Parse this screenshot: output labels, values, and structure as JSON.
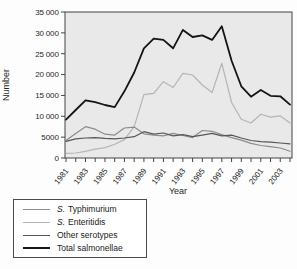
{
  "chart_data": {
    "type": "line",
    "title": "",
    "xlabel": "Year",
    "ylabel": "Number",
    "ylim": [
      0,
      35000
    ],
    "ytick_step": 5000,
    "x_label_every": 2,
    "grid": false,
    "plot_bg": "#e9e9e9",
    "axis_color": "#444444",
    "legend_position": "bottom-left",
    "years": [
      1981,
      1982,
      1983,
      1984,
      1985,
      1986,
      1987,
      1988,
      1989,
      1990,
      1991,
      1992,
      1993,
      1994,
      1995,
      1996,
      1997,
      1998,
      1999,
      2000,
      2001,
      2002,
      2003,
      2004
    ],
    "draw_order": [
      1,
      0,
      2,
      3
    ],
    "series": [
      {
        "name": "S. Typhimurium",
        "color": "#8c8c8c",
        "width": 1.2,
        "values": [
          4200,
          5900,
          7500,
          6900,
          5700,
          5500,
          7200,
          7400,
          5800,
          5500,
          5300,
          5900,
          5400,
          4900,
          6600,
          6400,
          5600,
          4900,
          4300,
          3500,
          3000,
          2700,
          2400,
          1600
        ]
      },
      {
        "name": "S. Enteritidis",
        "color": "#b5b5b5",
        "width": 1.2,
        "values": [
          1100,
          1200,
          1600,
          2100,
          2500,
          3300,
          4400,
          7500,
          15200,
          15500,
          18300,
          16900,
          20300,
          19900,
          17500,
          15700,
          22700,
          13300,
          9300,
          8400,
          10500,
          9800,
          10100,
          8400
        ]
      },
      {
        "name": "Other serotypes",
        "color": "#575757",
        "width": 1.2,
        "values": [
          4000,
          4600,
          4800,
          4900,
          4700,
          4600,
          4800,
          5100,
          6300,
          5700,
          6000,
          5300,
          5600,
          5100,
          5500,
          5900,
          5300,
          5500,
          4800,
          4200,
          3900,
          3800,
          3600,
          3400
        ]
      },
      {
        "name": "Total salmonellae",
        "color": "#141414",
        "width": 1.8,
        "values": [
          9200,
          11500,
          13800,
          13400,
          12700,
          12200,
          16000,
          20500,
          26300,
          28600,
          28300,
          26300,
          30700,
          29000,
          29400,
          28300,
          31600,
          23300,
          17200,
          14700,
          16300,
          14900,
          14800,
          12800
        ]
      }
    ]
  },
  "legend": {
    "items": [
      {
        "prefix": "S.",
        "label": "Typhimurium"
      },
      {
        "prefix": "S.",
        "label": "Enteritidis"
      },
      {
        "prefix": "",
        "label": "Other serotypes"
      },
      {
        "prefix": "",
        "label": "Total salmonellae"
      }
    ]
  }
}
